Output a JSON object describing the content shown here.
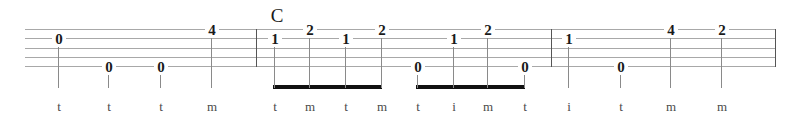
{
  "sheet": {
    "instrument_tab_type": "banjo-tablature",
    "width": 806,
    "height": 119,
    "background_color": "#ffffff",
    "staff": {
      "line_count": 5,
      "line_color": "#a8a8a8",
      "left_x": 25,
      "right_x": 776,
      "line_y": [
        29,
        38,
        48,
        57,
        66
      ]
    },
    "barlines": [
      {
        "name": "barline-1",
        "x": 256,
        "y_top": 29,
        "y_bottom": 66
      },
      {
        "name": "barline-2",
        "x": 551,
        "y_top": 29,
        "y_bottom": 66
      },
      {
        "name": "barline-end",
        "x": 775,
        "y_top": 29,
        "y_bottom": 66
      }
    ],
    "chord_labels": [
      {
        "text": "C",
        "x": 266,
        "y": 6
      }
    ],
    "notes": [
      {
        "fret": "0",
        "string": 2,
        "x": 58,
        "num_y": 32,
        "stem_top": 40,
        "stem_bottom": 88,
        "finger": "t",
        "beamed": false
      },
      {
        "fret": "0",
        "string": 5,
        "x": 108,
        "num_y": 60,
        "stem_top": 68,
        "stem_bottom": 88,
        "finger": "t",
        "beamed": false
      },
      {
        "fret": "0",
        "string": 5,
        "x": 160,
        "num_y": 60,
        "stem_top": 68,
        "stem_bottom": 88,
        "finger": "t",
        "beamed": false
      },
      {
        "fret": "4",
        "string": 1,
        "x": 211,
        "num_y": 23,
        "stem_top": 31,
        "stem_bottom": 88,
        "finger": "m",
        "beamed": false
      },
      {
        "fret": "1",
        "string": 2,
        "x": 274,
        "num_y": 32,
        "stem_top": 40,
        "stem_bottom": 88,
        "finger": "t",
        "beamed": true
      },
      {
        "fret": "2",
        "string": 1,
        "x": 309,
        "num_y": 23,
        "stem_top": 31,
        "stem_bottom": 88,
        "finger": "m",
        "beamed": true
      },
      {
        "fret": "1",
        "string": 2,
        "x": 345,
        "num_y": 32,
        "stem_top": 40,
        "stem_bottom": 88,
        "finger": "t",
        "beamed": true
      },
      {
        "fret": "2",
        "string": 1,
        "x": 381,
        "num_y": 23,
        "stem_top": 31,
        "stem_bottom": 88,
        "finger": "m",
        "beamed": true
      },
      {
        "fret": "0",
        "string": 5,
        "x": 417,
        "num_y": 60,
        "stem_top": 68,
        "stem_bottom": 88,
        "finger": "t",
        "beamed": true
      },
      {
        "fret": "1",
        "string": 2,
        "x": 453,
        "num_y": 32,
        "stem_top": 40,
        "stem_bottom": 88,
        "finger": "i",
        "beamed": true
      },
      {
        "fret": "2",
        "string": 1,
        "x": 487,
        "num_y": 23,
        "stem_top": 31,
        "stem_bottom": 88,
        "finger": "m",
        "beamed": true
      },
      {
        "fret": "0",
        "string": 5,
        "x": 524,
        "num_y": 60,
        "stem_top": 68,
        "stem_bottom": 88,
        "finger": "t",
        "beamed": true
      },
      {
        "fret": "1",
        "string": 2,
        "x": 568,
        "num_y": 32,
        "stem_top": 40,
        "stem_bottom": 88,
        "finger": "i",
        "beamed": false
      },
      {
        "fret": "0",
        "string": 5,
        "x": 620,
        "num_y": 60,
        "stem_top": 68,
        "stem_bottom": 88,
        "finger": "t",
        "beamed": false
      },
      {
        "fret": "4",
        "string": 1,
        "x": 670,
        "num_y": 23,
        "stem_top": 31,
        "stem_bottom": 88,
        "finger": "m",
        "beamed": false
      },
      {
        "fret": "2",
        "string": 1,
        "x": 721,
        "num_y": 23,
        "stem_top": 31,
        "stem_bottom": 88,
        "finger": "m",
        "beamed": false
      }
    ],
    "beams": [
      {
        "name": "beam-group-1",
        "x_start": 273,
        "x_end": 382,
        "y": 85,
        "color": "#111111"
      },
      {
        "name": "beam-group-2",
        "x_start": 416,
        "x_end": 525,
        "y": 85,
        "color": "#111111"
      }
    ],
    "finger_letter_y": 100
  }
}
